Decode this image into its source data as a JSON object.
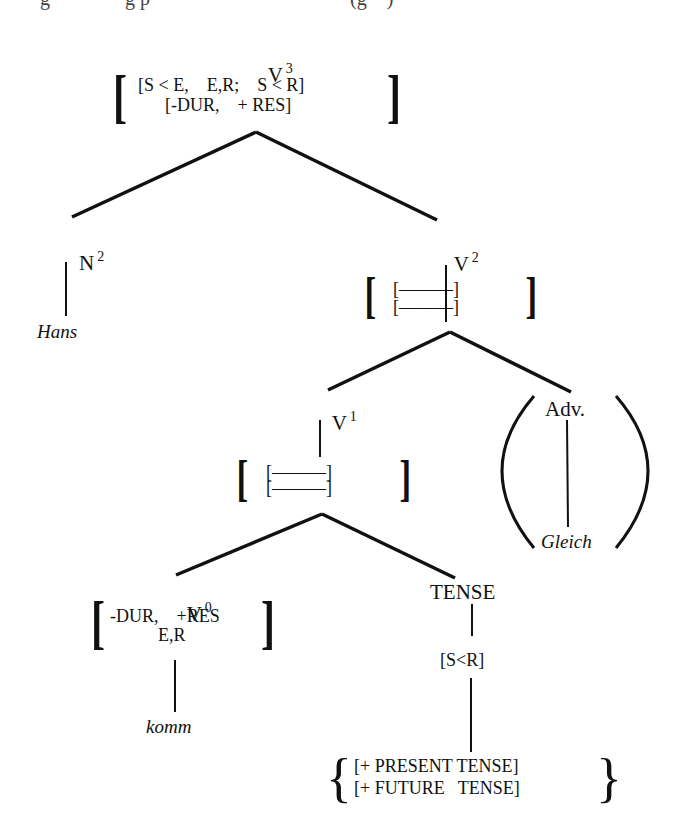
{
  "top_cutoff_text": "g               g p                                        (g    )",
  "tree": {
    "root": {
      "label": "V",
      "superscript": "3",
      "features_line1": "[S < E,    E,R;    S < R]",
      "features_line2": "[-DUR,    + RES]"
    },
    "n2": {
      "label": "N",
      "superscript": "2",
      "leaf": "Hans"
    },
    "v2": {
      "label": "V",
      "superscript": "2",
      "features_line1": "[———]",
      "features_line2": "[———]"
    },
    "v1": {
      "label": "V",
      "superscript": "1",
      "features_line1": "[———]",
      "features_line2": "[———]"
    },
    "adv": {
      "label": "Adv.",
      "leaf": "Gleich",
      "optional": true
    },
    "v0": {
      "label": "V",
      "superscript": "0",
      "features_line1": "-DUR,    +RES",
      "features_line2": "E,R",
      "leaf": "komm"
    },
    "tense": {
      "label": "TENSE",
      "feature": "[S<R]",
      "options": [
        "[+ PRESENT TENSE]",
        "[+ FUTURE   TENSE]"
      ]
    }
  }
}
